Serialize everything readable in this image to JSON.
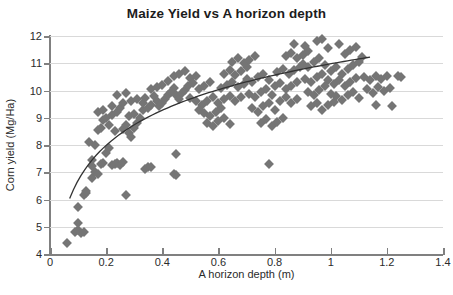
{
  "chart_data": {
    "type": "scatter",
    "title": "Maize Yield vs A horizon depth",
    "xlabel": "A horizon depth (m)",
    "ylabel": "Corn yield (Mg/Ha)",
    "xlim": [
      0,
      1.4
    ],
    "ylim": [
      4,
      12
    ],
    "xticks": [
      "0",
      "0.2",
      "0.4",
      "0.6",
      "0.8",
      "1",
      "1.2",
      "1.4"
    ],
    "xtick_values": [
      0,
      0.2,
      0.4,
      0.6,
      0.8,
      1.0,
      1.2,
      1.4
    ],
    "yticks": [
      "4",
      "5",
      "6",
      "7",
      "8",
      "9",
      "10",
      "11",
      "12"
    ],
    "ytick_values": [
      4,
      5,
      6,
      7,
      8,
      9,
      10,
      11,
      12
    ],
    "grid": "horizontal",
    "legend": "none",
    "marker_shape": "diamond",
    "marker_color": "#757575",
    "trendline_color": "#333333",
    "trendline_type": "logarithmic",
    "series": [
      {
        "name": "Observations",
        "points": [
          [
            0.06,
            4.42
          ],
          [
            0.09,
            4.8
          ],
          [
            0.1,
            4.88
          ],
          [
            0.1,
            5.12
          ],
          [
            0.11,
            4.78
          ],
          [
            0.12,
            4.8
          ],
          [
            0.1,
            5.72
          ],
          [
            0.12,
            6.18
          ],
          [
            0.13,
            6.25
          ],
          [
            0.13,
            6.32
          ],
          [
            0.15,
            6.78
          ],
          [
            0.16,
            7.0
          ],
          [
            0.17,
            6.95
          ],
          [
            0.15,
            7.22
          ],
          [
            0.15,
            7.45
          ],
          [
            0.18,
            7.3
          ],
          [
            0.19,
            7.35
          ],
          [
            0.2,
            7.72
          ],
          [
            0.21,
            7.9
          ],
          [
            0.22,
            7.28
          ],
          [
            0.23,
            7.3
          ],
          [
            0.24,
            7.35
          ],
          [
            0.25,
            7.28
          ],
          [
            0.26,
            7.38
          ],
          [
            0.27,
            6.18
          ],
          [
            0.34,
            7.12
          ],
          [
            0.35,
            7.18
          ],
          [
            0.36,
            7.2
          ],
          [
            0.44,
            6.92
          ],
          [
            0.45,
            6.9
          ],
          [
            0.45,
            7.68
          ],
          [
            0.16,
            8.0
          ],
          [
            0.14,
            8.1
          ],
          [
            0.17,
            8.55
          ],
          [
            0.18,
            8.62
          ],
          [
            0.19,
            8.9
          ],
          [
            0.2,
            9.0
          ],
          [
            0.21,
            8.75
          ],
          [
            0.22,
            9.1
          ],
          [
            0.17,
            9.22
          ],
          [
            0.19,
            9.3
          ],
          [
            0.22,
            9.42
          ],
          [
            0.24,
            9.2
          ],
          [
            0.25,
            9.35
          ],
          [
            0.23,
            8.52
          ],
          [
            0.26,
            8.6
          ],
          [
            0.27,
            8.72
          ],
          [
            0.28,
            8.45
          ],
          [
            0.29,
            8.3
          ],
          [
            0.3,
            8.62
          ],
          [
            0.31,
            8.8
          ],
          [
            0.28,
            9.05
          ],
          [
            0.3,
            9.12
          ],
          [
            0.32,
            9.0
          ],
          [
            0.33,
            9.28
          ],
          [
            0.26,
            9.55
          ],
          [
            0.29,
            9.62
          ],
          [
            0.31,
            9.7
          ],
          [
            0.24,
            9.82
          ],
          [
            0.27,
            9.9
          ],
          [
            0.33,
            9.55
          ],
          [
            0.35,
            9.35
          ],
          [
            0.36,
            9.48
          ],
          [
            0.34,
            9.72
          ],
          [
            0.37,
            9.78
          ],
          [
            0.38,
            9.6
          ],
          [
            0.39,
            9.42
          ],
          [
            0.4,
            9.55
          ],
          [
            0.41,
            9.7
          ],
          [
            0.42,
            9.85
          ],
          [
            0.36,
            10.05
          ],
          [
            0.38,
            10.12
          ],
          [
            0.4,
            10.22
          ],
          [
            0.42,
            10.35
          ],
          [
            0.44,
            10.1
          ],
          [
            0.43,
            9.95
          ],
          [
            0.45,
            9.82
          ],
          [
            0.46,
            9.68
          ],
          [
            0.47,
            9.9
          ],
          [
            0.48,
            10.02
          ],
          [
            0.44,
            10.55
          ],
          [
            0.46,
            10.62
          ],
          [
            0.48,
            10.7
          ],
          [
            0.5,
            10.45
          ],
          [
            0.52,
            10.55
          ],
          [
            0.49,
            10.18
          ],
          [
            0.51,
            10.28
          ],
          [
            0.53,
            10.05
          ],
          [
            0.55,
            10.18
          ],
          [
            0.57,
            10.3
          ],
          [
            0.5,
            9.72
          ],
          [
            0.52,
            9.6
          ],
          [
            0.54,
            9.48
          ],
          [
            0.56,
            9.62
          ],
          [
            0.58,
            9.75
          ],
          [
            0.53,
            9.3
          ],
          [
            0.55,
            9.18
          ],
          [
            0.57,
            9.05
          ],
          [
            0.59,
            9.22
          ],
          [
            0.61,
            9.35
          ],
          [
            0.56,
            8.82
          ],
          [
            0.58,
            8.7
          ],
          [
            0.6,
            8.88
          ],
          [
            0.62,
            9.0
          ],
          [
            0.64,
            8.78
          ],
          [
            0.6,
            9.55
          ],
          [
            0.62,
            9.68
          ],
          [
            0.64,
            9.8
          ],
          [
            0.66,
            9.62
          ],
          [
            0.68,
            9.75
          ],
          [
            0.61,
            10.08
          ],
          [
            0.63,
            10.2
          ],
          [
            0.65,
            10.32
          ],
          [
            0.67,
            10.12
          ],
          [
            0.69,
            10.25
          ],
          [
            0.62,
            10.62
          ],
          [
            0.64,
            10.75
          ],
          [
            0.66,
            10.58
          ],
          [
            0.68,
            10.7
          ],
          [
            0.7,
            10.85
          ],
          [
            0.65,
            11.05
          ],
          [
            0.67,
            11.18
          ],
          [
            0.69,
            11.0
          ],
          [
            0.71,
            11.12
          ],
          [
            0.73,
            11.25
          ],
          [
            0.7,
            10.42
          ],
          [
            0.72,
            10.3
          ],
          [
            0.74,
            10.48
          ],
          [
            0.76,
            10.6
          ],
          [
            0.78,
            10.38
          ],
          [
            0.71,
            9.88
          ],
          [
            0.73,
            9.75
          ],
          [
            0.75,
            9.95
          ],
          [
            0.77,
            10.05
          ],
          [
            0.79,
            9.82
          ],
          [
            0.72,
            9.35
          ],
          [
            0.74,
            9.22
          ],
          [
            0.76,
            9.42
          ],
          [
            0.78,
            9.55
          ],
          [
            0.8,
            9.28
          ],
          [
            0.75,
            8.82
          ],
          [
            0.77,
            8.95
          ],
          [
            0.79,
            8.7
          ],
          [
            0.81,
            8.85
          ],
          [
            0.83,
            9.0
          ],
          [
            0.78,
            7.3
          ],
          [
            0.82,
            9.62
          ],
          [
            0.84,
            9.75
          ],
          [
            0.86,
            9.55
          ],
          [
            0.88,
            9.68
          ],
          [
            0.8,
            10.15
          ],
          [
            0.82,
            10.28
          ],
          [
            0.84,
            10.05
          ],
          [
            0.86,
            10.18
          ],
          [
            0.88,
            10.32
          ],
          [
            0.81,
            10.68
          ],
          [
            0.83,
            10.8
          ],
          [
            0.85,
            10.62
          ],
          [
            0.87,
            10.75
          ],
          [
            0.89,
            10.88
          ],
          [
            0.84,
            11.25
          ],
          [
            0.86,
            11.38
          ],
          [
            0.88,
            11.18
          ],
          [
            0.9,
            11.3
          ],
          [
            0.92,
            11.45
          ],
          [
            0.87,
            11.72
          ],
          [
            0.91,
            11.62
          ],
          [
            0.95,
            11.8
          ],
          [
            0.97,
            11.88
          ],
          [
            0.99,
            11.55
          ],
          [
            0.9,
            10.98
          ],
          [
            0.92,
            10.85
          ],
          [
            0.94,
            11.05
          ],
          [
            0.96,
            11.18
          ],
          [
            0.98,
            10.92
          ],
          [
            0.91,
            10.42
          ],
          [
            0.93,
            10.3
          ],
          [
            0.95,
            10.5
          ],
          [
            0.97,
            10.62
          ],
          [
            0.99,
            10.38
          ],
          [
            0.92,
            9.95
          ],
          [
            0.94,
            9.82
          ],
          [
            0.96,
            10.02
          ],
          [
            0.98,
            10.15
          ],
          [
            1.0,
            9.88
          ],
          [
            0.93,
            9.42
          ],
          [
            0.95,
            9.55
          ],
          [
            0.97,
            9.3
          ],
          [
            0.99,
            9.45
          ],
          [
            1.01,
            9.58
          ],
          [
            1.0,
            10.72
          ],
          [
            1.02,
            10.85
          ],
          [
            1.04,
            10.62
          ],
          [
            1.06,
            10.78
          ],
          [
            1.08,
            10.92
          ],
          [
            1.01,
            10.25
          ],
          [
            1.03,
            10.38
          ],
          [
            1.05,
            10.15
          ],
          [
            1.07,
            10.3
          ],
          [
            1.09,
            10.45
          ],
          [
            1.02,
            9.78
          ],
          [
            1.04,
            9.65
          ],
          [
            1.06,
            9.85
          ],
          [
            1.08,
            9.95
          ],
          [
            1.1,
            9.72
          ],
          [
            1.05,
            11.35
          ],
          [
            1.07,
            11.48
          ],
          [
            1.09,
            11.6
          ],
          [
            1.03,
            11.72
          ],
          [
            1.11,
            11.22
          ],
          [
            1.12,
            10.5
          ],
          [
            1.14,
            10.38
          ],
          [
            1.16,
            10.55
          ],
          [
            1.18,
            10.42
          ],
          [
            1.2,
            10.55
          ],
          [
            1.13,
            10.05
          ],
          [
            1.15,
            9.92
          ],
          [
            1.17,
            10.12
          ],
          [
            1.19,
            9.98
          ],
          [
            1.21,
            10.1
          ],
          [
            1.22,
            9.42
          ],
          [
            1.24,
            10.52
          ],
          [
            1.25,
            10.48
          ],
          [
            1.16,
            9.45
          ],
          [
            1.1,
            11.05
          ]
        ]
      }
    ],
    "trendline": {
      "x_start": 0.07,
      "x_end": 1.14,
      "y_start": 5.85,
      "y_end": 10.78,
      "equation_form": "y = a + b*ln(x)",
      "a": 10.98,
      "b": 1.86
    }
  }
}
